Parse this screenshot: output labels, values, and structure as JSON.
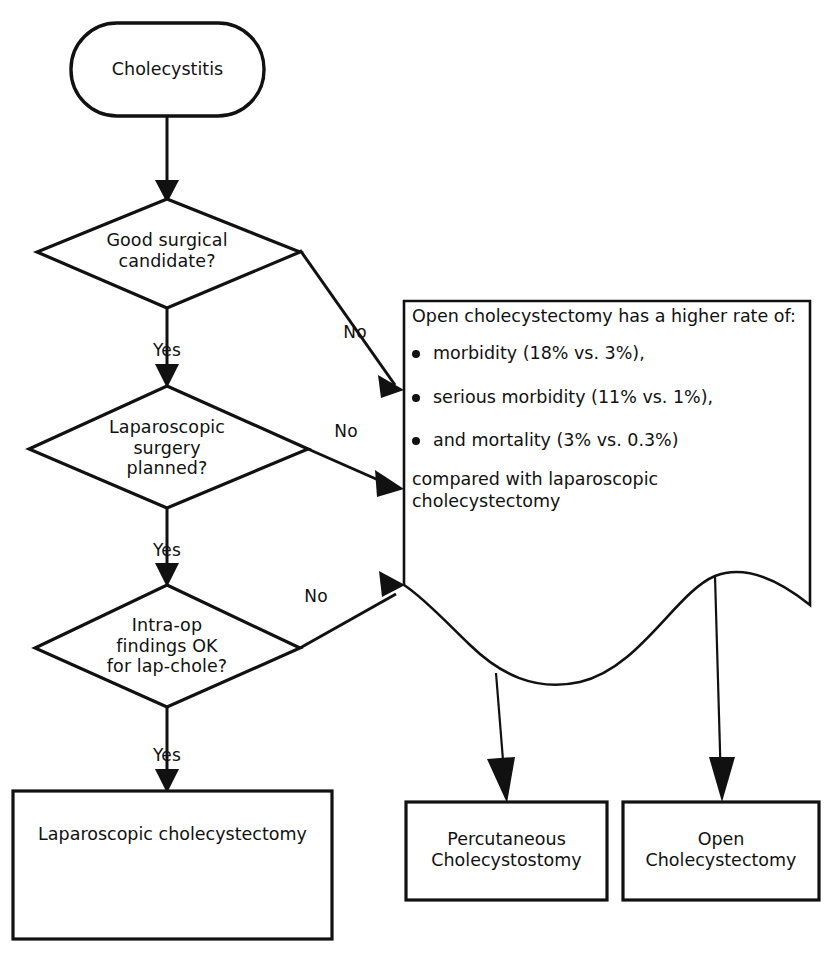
{
  "diagram": {
    "stroke_color": "#111111",
    "fill_color": "#ffffff"
  },
  "start_node": {
    "label": "Cholecystitis",
    "shape": "rounded-terminator"
  },
  "decisions": [
    {
      "id": "good-surgical-candidate",
      "label": "Good surgical\ncandidate?",
      "yes_label": "Yes",
      "no_label": "No"
    },
    {
      "id": "laparoscopic-surgery-planned",
      "label": "Laparoscopic\nsurgery\nplanned?",
      "yes_label": "Yes",
      "no_label": "No"
    },
    {
      "id": "intra-op-findings",
      "label": "Intra-op\nfindings OK\nfor lap-chole?",
      "yes_label": "Yes",
      "no_label": "No"
    }
  ],
  "note": {
    "heading": "Open cholecystectomy has a higher rate of:",
    "bullets": [
      "morbidity (18% vs. 3%),",
      "serious morbidity (11% vs. 1%),",
      "and mortality (3% vs. 0.3%)"
    ],
    "footer": "compared with laparoscopic cholecystectomy"
  },
  "results": [
    {
      "id": "laparoscopic-cholecystectomy",
      "label": "Laparoscopic cholecystectomy"
    },
    {
      "id": "percutaneous-cholecystostomy",
      "label": "Percutaneous\nCholecystostomy"
    },
    {
      "id": "open-cholecystectomy",
      "label": "Open\nCholecystectomy"
    }
  ],
  "edge_labels": {
    "no_1": "No",
    "no_2": "No",
    "no_3": "No",
    "yes_1": "Yes",
    "yes_2": "Yes",
    "yes_3": "Yes"
  }
}
